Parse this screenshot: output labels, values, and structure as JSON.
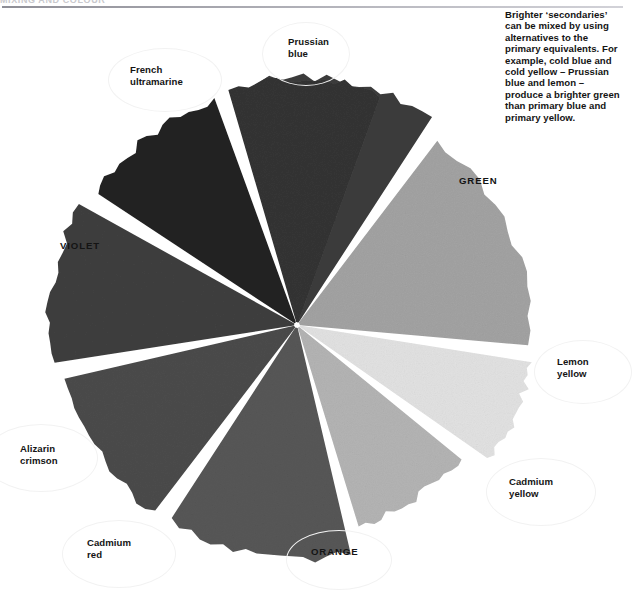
{
  "header": {
    "running_head": "MIXING AND COLOUR"
  },
  "caption": {
    "text": "Brighter ‘secondaries’ can be mixed by using alternatives to the primary equivalents. For example, cold blue and cold yellow – Prussian blue and lemon – produce a brighter green than primary blue and primary yellow."
  },
  "chart_data": {
    "type": "pie",
    "xlabel": "",
    "ylabel": "",
    "grid": false,
    "legend": "none",
    "note": "Greyscale reproduction of a painted colour wheel; each wedge is a hand-painted segment separated by white paper gaps. Angles measured clockwise from 12 o'clock.",
    "center": {
      "x": 297,
      "y": 325
    },
    "categories": [
      "Prussian blue",
      "GREEN",
      "Lemon yellow",
      "Cadmium yellow",
      "ORANGE",
      "Cadmium red",
      "Alizarin crimson",
      "VIOLET",
      "French ultramarine"
    ],
    "values": [
      42,
      58,
      26,
      34,
      46,
      40,
      38,
      52,
      36
    ],
    "segments": [
      {
        "label": "Prussian blue",
        "kind": "primary",
        "start_angle": -9,
        "end_angle": 33,
        "radius": 248,
        "fill": "#3c3c3c",
        "label_case": "title"
      },
      {
        "label": "GREEN",
        "kind": "secondary",
        "start_angle": 37,
        "end_angle": 95,
        "radius": 232,
        "fill": "#a3a3a3",
        "label_case": "upper"
      },
      {
        "label": "Lemon yellow",
        "kind": "primary",
        "start_angle": 99,
        "end_angle": 125,
        "radius": 236,
        "fill": "#e2e2e2",
        "label_case": "title"
      },
      {
        "label": "Cadmium yellow",
        "kind": "primary",
        "start_angle": 129,
        "end_angle": 163,
        "radius": 210,
        "fill": "#b4b4b4",
        "label_case": "title"
      },
      {
        "label": "ORANGE",
        "kind": "secondary",
        "start_angle": 167,
        "end_angle": 213,
        "radius": 234,
        "fill": "#575757",
        "label_case": "upper"
      },
      {
        "label": "Cadmium red",
        "kind": "primary",
        "start_angle": 217,
        "end_angle": 257,
        "radius": 236,
        "fill": "#4b4b4b",
        "label_case": "title"
      },
      {
        "label": "Alizarin crimson",
        "kind": "primary",
        "start_angle": 261,
        "end_angle": 299,
        "radius": 248,
        "fill": "#3f3f3f",
        "label_case": "title"
      },
      {
        "label": "VIOLET",
        "kind": "secondary",
        "start_angle": 303,
        "end_angle": 340,
        "radius": 240,
        "fill": "#242424",
        "label_case": "upper"
      },
      {
        "label": "French ultramarine",
        "kind": "primary",
        "start_angle": 344,
        "end_angle": 380,
        "radius": 246,
        "fill": "#343434",
        "label_case": "title"
      }
    ]
  },
  "labels": {
    "prussian_blue": "Prussian\nblue",
    "french_ultramarine": "French\nultramarine",
    "violet": "VIOLET",
    "alizarin_crimson": "Alizarin\ncrimson",
    "cadmium_red": "Cadmium\nred",
    "orange": "ORANGE",
    "cadmium_yellow": "Cadmium\nyellow",
    "lemon_yellow": "Lemon\nyellow",
    "green": "GREEN"
  },
  "colors": {
    "page_background": "#ffffff",
    "text": "#141414",
    "rule": "#9a9aa2",
    "halo": "#f2f2f2"
  }
}
